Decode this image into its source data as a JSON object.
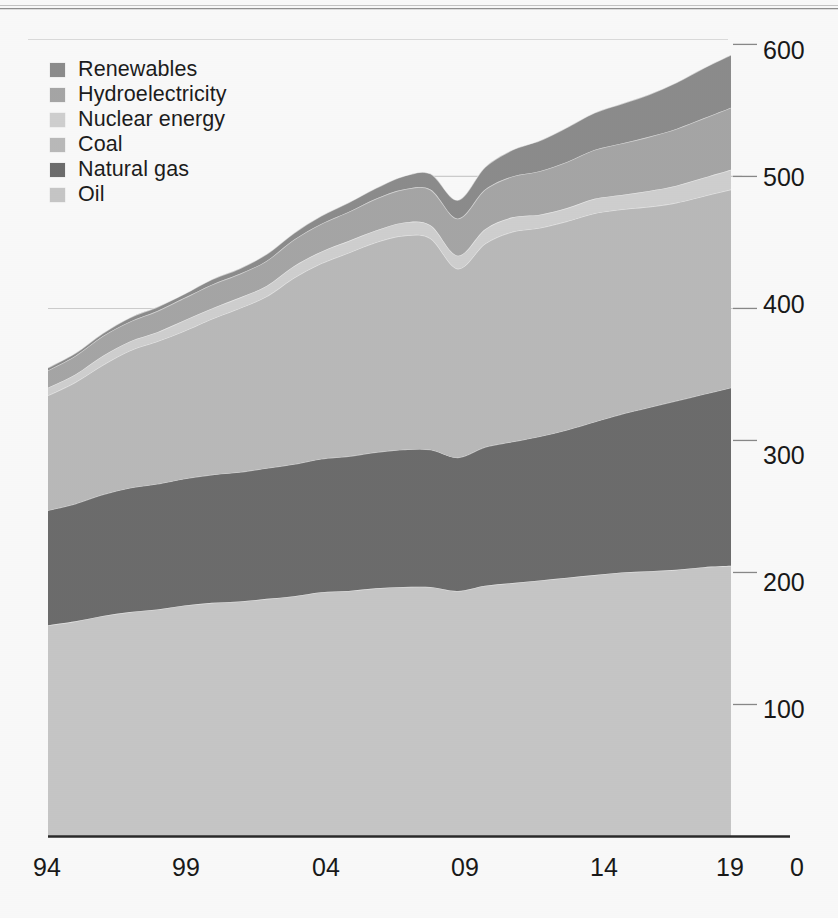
{
  "chart_data": {
    "type": "area",
    "stacked": true,
    "title": "",
    "subtitle": "",
    "xlabel": "",
    "ylabel": "",
    "x": [
      1994,
      1995,
      1996,
      1997,
      1998,
      1999,
      2000,
      2001,
      2002,
      2003,
      2004,
      2005,
      2006,
      2007,
      2008,
      2009,
      2010,
      2011,
      2012,
      2013,
      2014,
      2015,
      2016,
      2017,
      2018,
      2019
    ],
    "xtick_labels": [
      "94",
      "99",
      "04",
      "09",
      "14",
      "19"
    ],
    "xtick_values": [
      1994,
      1999,
      2004,
      2009,
      2014,
      2019
    ],
    "ytick_labels": [
      "600",
      "500",
      "400",
      "300",
      "200",
      "100",
      "0"
    ],
    "ytick_values": [
      600,
      500,
      400,
      300,
      200,
      100,
      0
    ],
    "ylim": [
      0,
      620
    ],
    "yaxis_position": "right",
    "grid": "horizontal-faint",
    "legend_position": "top-left",
    "series": [
      {
        "name": "Oil",
        "color": "#c9c9c9",
        "values": [
          160,
          163,
          167,
          170,
          172,
          175,
          177,
          178,
          180,
          182,
          185,
          186,
          188,
          189,
          189,
          186,
          190,
          192,
          194,
          196,
          198,
          200,
          201,
          202,
          204,
          205
        ]
      },
      {
        "name": "Natural gas",
        "color": "#6e6e6e",
        "values": [
          87,
          89,
          92,
          94,
          95,
          96,
          97,
          98,
          99,
          100,
          101,
          102,
          103,
          104,
          104,
          101,
          105,
          107,
          109,
          112,
          116,
          120,
          124,
          128,
          131,
          135
        ]
      },
      {
        "name": "Coal",
        "color": "#bcbcbc",
        "values": [
          87,
          92,
          98,
          104,
          108,
          112,
          118,
          124,
          130,
          141,
          148,
          154,
          159,
          162,
          160,
          143,
          154,
          159,
          158,
          158,
          158,
          155,
          152,
          150,
          150,
          150
        ]
      },
      {
        "name": "Nuclear energy",
        "color": "#d2d2d2",
        "values": [
          6,
          6,
          7,
          7,
          7,
          8,
          8,
          8,
          8,
          9,
          9,
          9,
          9,
          10,
          10,
          10,
          11,
          11,
          10,
          10,
          11,
          11,
          12,
          13,
          14,
          15
        ]
      },
      {
        "name": "Hydroelectricity",
        "color": "#a8a8a8",
        "values": [
          13,
          14,
          15,
          15,
          16,
          17,
          18,
          18,
          19,
          20,
          21,
          22,
          24,
          25,
          27,
          28,
          30,
          31,
          33,
          35,
          37,
          39,
          41,
          43,
          45,
          47
        ]
      },
      {
        "name": "Renewables",
        "color": "#8e8e8e",
        "values": [
          2,
          2,
          2,
          3,
          3,
          3,
          4,
          4,
          5,
          5,
          6,
          7,
          8,
          10,
          12,
          14,
          17,
          20,
          23,
          26,
          28,
          30,
          32,
          35,
          38,
          40
        ]
      }
    ]
  },
  "legend": {
    "items": [
      {
        "label": "Renewables",
        "color": "#8e8e8e"
      },
      {
        "label": "Hydroelectricity",
        "color": "#a8a8a8"
      },
      {
        "label": "Nuclear energy",
        "color": "#d2d2d2"
      },
      {
        "label": "Coal",
        "color": "#bcbcbc"
      },
      {
        "label": "Natural gas",
        "color": "#6e6e6e"
      },
      {
        "label": "Oil",
        "color": "#c9c9c9"
      }
    ]
  },
  "axes": {
    "y_labels": [
      "600",
      "500",
      "400",
      "300",
      "200",
      "100"
    ],
    "x_labels": [
      "94",
      "99",
      "04",
      "09",
      "14",
      "19"
    ],
    "origin_label": "0"
  }
}
